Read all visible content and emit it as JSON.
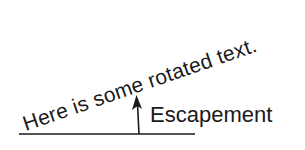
{
  "diagram": {
    "rotated_text": "Here is some rotated text.",
    "label": "Escapement",
    "rotation_deg": 19,
    "colors": {
      "ink": "#1a1a1a",
      "background": "#ffffff"
    },
    "baseline": {
      "x1": 19,
      "y1": 134,
      "x2": 195,
      "y2": 134
    },
    "arrow": {
      "x": 139,
      "y_start": 134,
      "y_tip": 95
    }
  }
}
